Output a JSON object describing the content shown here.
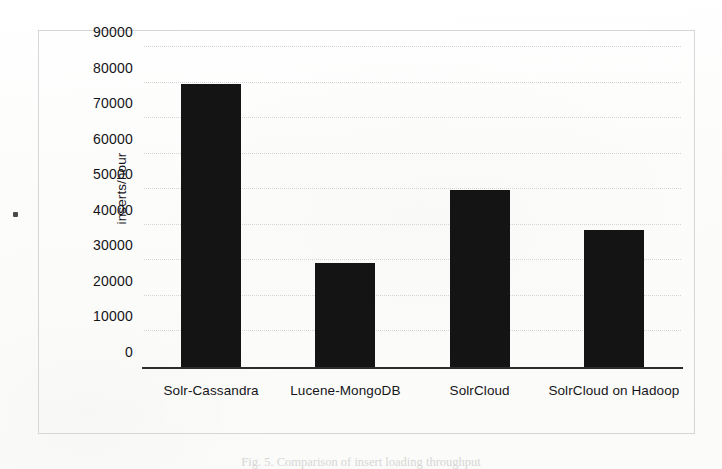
{
  "figure": {
    "caption": "Fig. 5.  Comparison of insert loading throughput"
  },
  "axes": {
    "y_title": "inserts/hour",
    "y_ticks": [
      "90000",
      "80000",
      "70000",
      "60000",
      "50000",
      "40000",
      "30000",
      "20000",
      "10000",
      "0"
    ],
    "x_labels": [
      "Solr-Cassandra",
      "Lucene-MongoDB",
      "SolrCloud",
      "SolrCloud on Hadoop"
    ]
  },
  "style": {
    "bar_color": "#141414",
    "frame_color": "#d6d6d6",
    "gridline_color": "#cfcfcf",
    "baseline_color": "#2c2c2c",
    "text_color": "#151519",
    "page_color": "#fdfdfc"
  },
  "chart_data": {
    "type": "bar",
    "title": "",
    "subtitle": "",
    "xlabel": "",
    "ylabel": "inserts/hour",
    "categories": [
      "Solr-Cassandra",
      "Lucene-MongoDB",
      "SolrCloud",
      "SolrCloud on Hadoop"
    ],
    "values": [
      80000,
      29500,
      50000,
      38800
    ],
    "ylim": [
      0,
      90000
    ],
    "ytick_step": 10000,
    "yticks": [
      0,
      10000,
      20000,
      30000,
      40000,
      50000,
      60000,
      70000,
      80000,
      90000
    ],
    "grid": true,
    "grid_axis": "y",
    "legend": false,
    "legend_position": "none",
    "series": [
      {
        "name": "inserts/hour",
        "values": [
          80000,
          29500,
          50000,
          38800
        ]
      }
    ],
    "annotations": []
  }
}
